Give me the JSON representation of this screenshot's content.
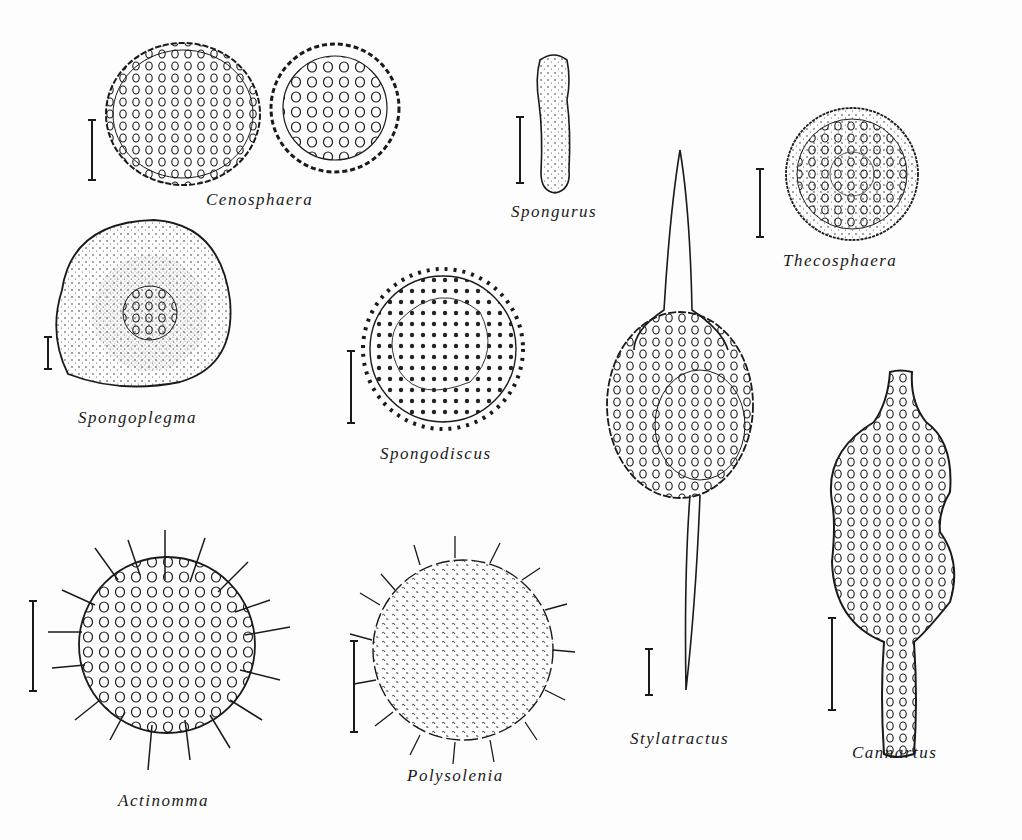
{
  "figure": {
    "background": "#fdfdfd",
    "ink_color": "#1a1a1a",
    "specimens": [
      {
        "id": "cenosphaera",
        "label": "Cenosphaera",
        "shape": "two porous spheres"
      },
      {
        "id": "spongurus",
        "label": "Spongurus",
        "shape": "elongated rod"
      },
      {
        "id": "thecosphaera",
        "label": "Thecosphaera",
        "shape": "concentric sphere"
      },
      {
        "id": "spongoplegma",
        "label": "Spongoplegma",
        "shape": "spongy sphere with porous core"
      },
      {
        "id": "spongodiscus",
        "label": "Spongodiscus",
        "shape": "spiny porous disc"
      },
      {
        "id": "stylatractus",
        "label": "Stylatractus",
        "shape": "sphere with two polar spines"
      },
      {
        "id": "cannartus",
        "label": "Cannartus",
        "shape": "constricted porous cylinder"
      },
      {
        "id": "actinomma",
        "label": "Actinomma",
        "shape": "spiny porous sphere"
      },
      {
        "id": "polysolenia",
        "label": "Polysolenia",
        "shape": "spiny sphere"
      }
    ]
  }
}
